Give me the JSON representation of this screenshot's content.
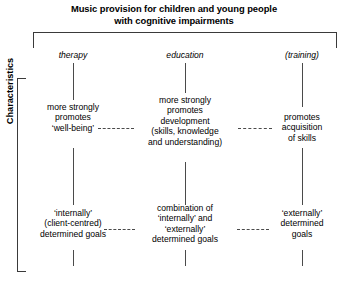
{
  "title": {
    "line1": "Music provision for children and young people",
    "line2": "with cognitive impairments"
  },
  "axis_label": "Characteristics",
  "columns": [
    {
      "label": "therapy"
    },
    {
      "label": "education"
    },
    {
      "label": "(training)"
    }
  ],
  "rows": [
    {
      "cells": [
        {
          "lines": [
            "more strongly",
            "promotes",
            "‘well-being’"
          ]
        },
        {
          "lines": [
            "more strongly",
            "promotes",
            "development",
            "(skills, knowledge",
            "and understanding)"
          ]
        },
        {
          "lines": [
            "promotes",
            "acquisition",
            "of skills"
          ]
        }
      ]
    },
    {
      "cells": [
        {
          "lines": [
            "‘internally’",
            "(client-centred)",
            "determined goals"
          ]
        },
        {
          "lines": [
            "combination of",
            "‘internally’ and",
            "‘externally’",
            "determined goals"
          ]
        },
        {
          "lines": [
            "‘externally’",
            "determined",
            "goals"
          ]
        }
      ]
    }
  ],
  "colors": {
    "background": "#ffffff",
    "text": "#000000",
    "line": "#3a3a3a",
    "connector": "#4a4a4a"
  }
}
